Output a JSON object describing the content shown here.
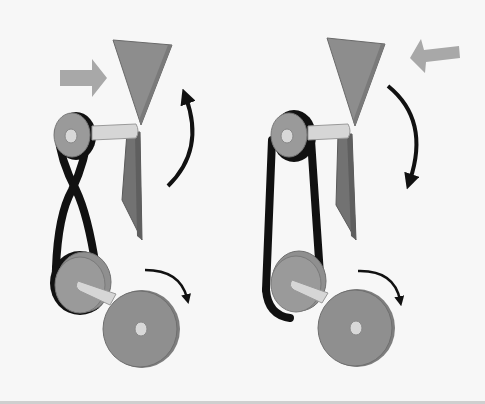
{
  "figure": {
    "panels": [
      {
        "id": "crossed-belt",
        "belt_type": "crossed",
        "airflow_direction": "right",
        "fan_rotation": "counterclockwise",
        "drive_rotation": "clockwise"
      },
      {
        "id": "open-belt",
        "belt_type": "open",
        "airflow_direction": "left",
        "fan_rotation": "clockwise",
        "drive_rotation": "clockwise"
      }
    ],
    "colors": {
      "background": "#f7f7f7",
      "blade": "#8c8c8c",
      "blade_dark": "#6e6e6e",
      "pulley": "#9a9a9a",
      "pulley_edge": "#7a7a7a",
      "shaft": "#d6d6d6",
      "belt": "#111111",
      "airflow_arrow": "#a8a8a8",
      "rotation_arrow": "#111111"
    }
  }
}
